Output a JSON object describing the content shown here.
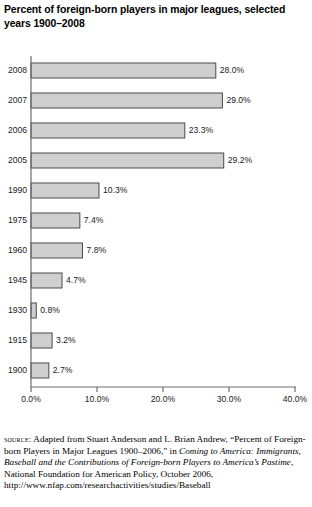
{
  "title": "Percent of foreign-born players in major leagues, selected years 1900–2008",
  "chart_data": {
    "type": "bar",
    "orientation": "horizontal",
    "title": "Percent of foreign-born players in major leagues, selected years 1900–2008",
    "xlabel": "",
    "ylabel": "",
    "categories": [
      "2008",
      "2007",
      "2006",
      "2005",
      "1990",
      "1975",
      "1960",
      "1945",
      "1930",
      "1915",
      "1900"
    ],
    "values": [
      28.0,
      29.0,
      23.3,
      29.2,
      10.3,
      7.4,
      7.8,
      4.7,
      0.8,
      3.2,
      2.7
    ],
    "data_labels": [
      "28.0%",
      "29.0%",
      "23.3%",
      "29.2%",
      "10.3%",
      "7.4%",
      "7.8%",
      "4.7%",
      "0.8%",
      "3.2%",
      "2.7%"
    ],
    "xlim": [
      0,
      40
    ],
    "x_ticks": [
      0,
      10,
      20,
      30,
      40
    ],
    "x_tick_labels": [
      "0.0%",
      "10.0%",
      "20.0%",
      "30.0%",
      "40.0%"
    ],
    "grid": false,
    "legend": false,
    "bar_fill_color": "#cfcfcf",
    "bar_edge_color": "#4a4a4a",
    "axis_color": "#6e6e6e"
  },
  "source": {
    "label": "source:",
    "text_part1": " Adapted from Stuart Anderson and L. Brian Andrew, “Percent of Foreign-born Players in Major Leagues 1900–2006,” in ",
    "italic1": "Coming to America: Immigrants, Baseball and the Contributions of Foreign-born Players to America’s Pastime",
    "text_part2": ", National Foundation for American Policy, October 2006, http://www.nfap.com/researchactivities/studies/Baseball"
  }
}
